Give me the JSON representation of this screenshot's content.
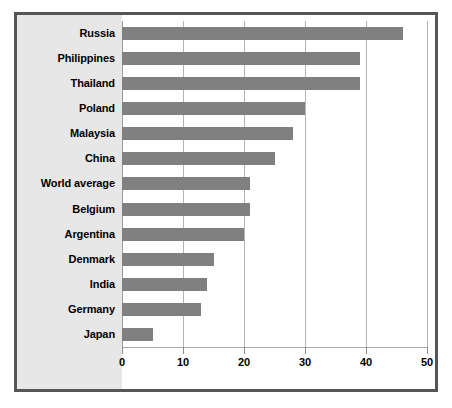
{
  "chart_data": {
    "type": "bar",
    "orientation": "horizontal",
    "title": "",
    "subtitle": "",
    "xlabel": "",
    "ylabel": "",
    "xlim": [
      0,
      50
    ],
    "xticks": [
      "0",
      "10",
      "20",
      "30",
      "40",
      "50"
    ],
    "grid": true,
    "legend": "none",
    "bar_color": "#808080",
    "panel_color": "#e7e7e7",
    "border_color": "#555557",
    "gridline_color": "#b4b4b4",
    "categories": [
      "Russia",
      "Philippines",
      "Thailand",
      "Poland",
      "Malaysia",
      "China",
      "World average",
      "Belgium",
      "Argentina",
      "Denmark",
      "India",
      "Germany",
      "Japan"
    ],
    "values": [
      46,
      39,
      39,
      30,
      28,
      25,
      21,
      21,
      20,
      15,
      14,
      13,
      5
    ]
  }
}
